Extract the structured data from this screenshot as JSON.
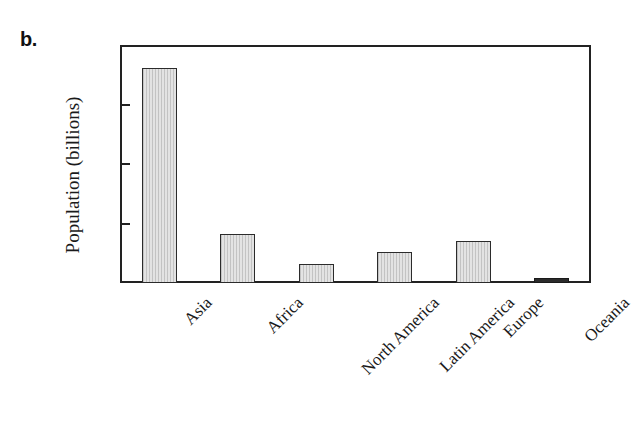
{
  "figure": {
    "panel_label": "b.",
    "background_color": "#ffffff",
    "frame_color": "#222222",
    "bar_fill_color": "#e3e3e3",
    "bar_edge_color": "#2b2b2b"
  },
  "chart_data": {
    "type": "bar",
    "title": "",
    "subtitle": "",
    "xlabel": "",
    "ylabel": "Population (billions)",
    "categories": [
      "Asia",
      "Africa",
      "North America",
      "Latin America",
      "Europe",
      "Oceania"
    ],
    "values": [
      3.61,
      0.82,
      0.32,
      0.52,
      0.71,
      0.03
    ],
    "ylim": [
      0,
      4
    ],
    "yticks": [
      0,
      1,
      2,
      3,
      4
    ],
    "ytick_labels": [
      "0",
      "1",
      "2",
      "3",
      "4"
    ],
    "grid": false,
    "legend": null,
    "annotations": [
      "b."
    ]
  }
}
